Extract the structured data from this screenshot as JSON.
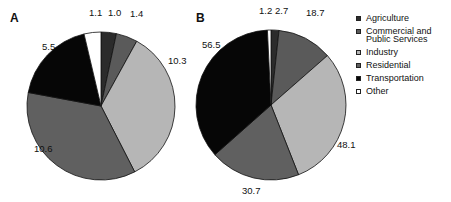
{
  "chart_data": [
    {
      "type": "pie",
      "title": "A",
      "categories": [
        "Agriculture",
        "Commercial and Public Services",
        "Industry",
        "Residential",
        "Transportation",
        "Other"
      ],
      "values": [
        1.0,
        1.4,
        10.3,
        10.6,
        5.5,
        1.1
      ],
      "start_angle": "12 o'clock",
      "direction": "clockwise"
    },
    {
      "type": "pie",
      "title": "B",
      "categories": [
        "Agriculture",
        "Commercial and Public Services",
        "Industry",
        "Residential",
        "Transportation",
        "Other"
      ],
      "values": [
        2.7,
        18.7,
        48.1,
        30.7,
        56.5,
        1.2
      ],
      "start_angle": "12 o'clock",
      "direction": "clockwise"
    }
  ],
  "legend": {
    "position": "right",
    "items": [
      {
        "label": "Agriculture",
        "color": "#2b2b2b"
      },
      {
        "label": "Commercial and Public Services",
        "color": "#5a5a5a"
      },
      {
        "label": "Industry",
        "color": "#b6b6b6"
      },
      {
        "label": "Residential",
        "color": "#606060"
      },
      {
        "label": "Transportation",
        "color": "#060606"
      },
      {
        "label": "Other",
        "color": "#ffffff"
      }
    ]
  },
  "panels": [
    {
      "label": "A",
      "cx": 101,
      "cy": 106,
      "r": 74,
      "value_label_pos": [
        [
          108,
          16
        ],
        [
          130,
          17
        ],
        [
          168,
          64
        ],
        [
          34,
          152
        ],
        [
          42,
          50
        ],
        [
          89,
          16
        ]
      ]
    },
    {
      "label": "B",
      "cx": 271,
      "cy": 105,
      "r": 75,
      "value_label_pos": [
        [
          275,
          14
        ],
        [
          306,
          16
        ],
        [
          337,
          148
        ],
        [
          242,
          194
        ],
        [
          202,
          48
        ],
        [
          259,
          14
        ]
      ]
    }
  ]
}
